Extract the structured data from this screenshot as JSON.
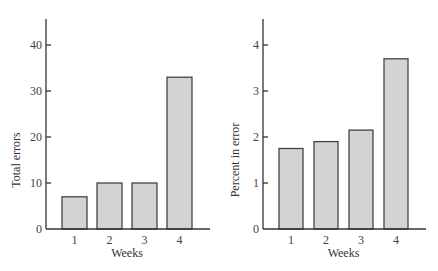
{
  "chart_data": [
    {
      "type": "bar",
      "title": "",
      "xlabel": "Weeks",
      "ylabel": "Total errors",
      "categories": [
        "1",
        "2",
        "3",
        "4"
      ],
      "values": [
        7,
        10,
        10,
        33
      ],
      "ylim": [
        0,
        45
      ],
      "yticks": [
        0,
        10,
        20,
        30,
        40
      ],
      "grid": false,
      "legend": null
    },
    {
      "type": "bar",
      "title": "",
      "xlabel": "Weeks",
      "ylabel": "Percent in error",
      "categories": [
        "1",
        "2",
        "3",
        "4"
      ],
      "values": [
        1.75,
        1.9,
        2.15,
        3.7
      ],
      "ylim": [
        0,
        4.5
      ],
      "yticks": [
        0,
        1,
        2,
        3,
        4
      ],
      "grid": false,
      "legend": null
    }
  ],
  "colors": {
    "bar_fill": "#d3d3d3",
    "bar_stroke": "#444444",
    "axis": "#333333"
  }
}
